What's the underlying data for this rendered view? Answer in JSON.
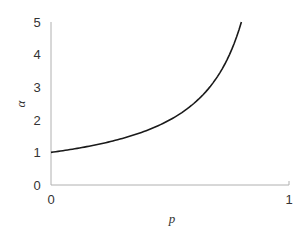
{
  "chart_data": {
    "type": "line",
    "title": "",
    "xlabel": "p",
    "ylabel": "α",
    "xlim": [
      0,
      1
    ],
    "ylim": [
      0,
      5
    ],
    "x_ticks": [
      "0",
      "1"
    ],
    "y_ticks": [
      "0",
      "1",
      "2",
      "3",
      "4",
      "5"
    ],
    "grid": false,
    "legend": null,
    "series": [
      {
        "name": "α = 1/(1−p)",
        "x": [
          0,
          0.1,
          0.2,
          0.3,
          0.4,
          0.5,
          0.6,
          0.65,
          0.7,
          0.75,
          0.8
        ],
        "values": [
          1.0,
          1.11,
          1.25,
          1.43,
          1.67,
          2.0,
          2.5,
          2.86,
          3.33,
          4.0,
          5.0
        ],
        "color": "#1a1a1a"
      }
    ]
  },
  "axes": {
    "x_tick_0": "0",
    "x_tick_1": "1",
    "y_tick_0": "0",
    "y_tick_1": "1",
    "y_tick_2": "2",
    "y_tick_3": "3",
    "y_tick_4": "4",
    "y_tick_5": "5",
    "xlabel": "p",
    "ylabel": "α",
    "axis_color": "#b0b0b0",
    "line_color": "#1a1a1a"
  }
}
